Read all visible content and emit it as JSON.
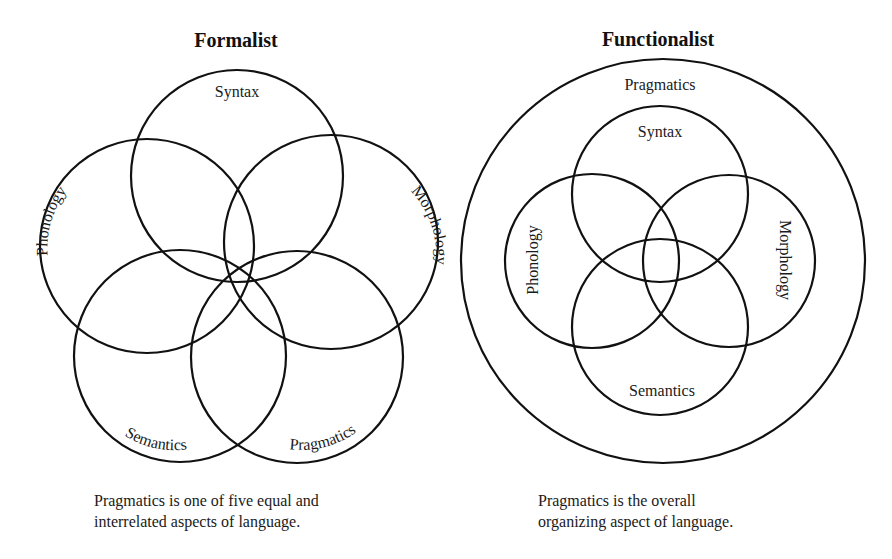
{
  "formalist": {
    "title": "Formalist",
    "circles": [
      {
        "id": "syntax",
        "label": "Syntax"
      },
      {
        "id": "phonology",
        "label": "Phonology"
      },
      {
        "id": "morphology",
        "label": "Morphology"
      },
      {
        "id": "semantics",
        "label": "Semantics"
      },
      {
        "id": "pragmatics",
        "label": "Pragmatics"
      }
    ],
    "caption": {
      "line1": "Pragmatics is one of five equal and",
      "line2": "interrelated aspects of language."
    }
  },
  "functionalist": {
    "title": "Functionalist",
    "outer": {
      "id": "pragmatics",
      "label": "Pragmatics"
    },
    "circles": [
      {
        "id": "syntax",
        "label": "Syntax"
      },
      {
        "id": "phonology",
        "label": "Phonology"
      },
      {
        "id": "morphology",
        "label": "Morphology"
      },
      {
        "id": "semantics",
        "label": "Semantics"
      }
    ],
    "caption": {
      "line1": "Pragmatics is the overall",
      "line2": "organizing aspect of language."
    }
  },
  "colors": {
    "stroke": "#111111",
    "text": "#1a1a1a",
    "background": "#ffffff"
  }
}
